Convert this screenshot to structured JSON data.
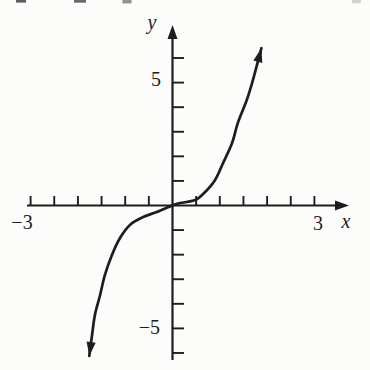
{
  "figure": {
    "background_color": "#fcfcfb",
    "ink_color": "#1d1d1d",
    "labels": {
      "y_axis": "y",
      "x_axis": "x",
      "y_max_tick": "5",
      "y_min_tick": "−5",
      "x_min_tick": "−3",
      "x_max_tick": "3"
    }
  },
  "chart_data": {
    "type": "line",
    "title": "",
    "xlabel": "x",
    "ylabel": "y",
    "x_range": [
      -3,
      3
    ],
    "y_range": [
      -6.5,
      7
    ],
    "x_tick_step": 0.5,
    "y_tick_step": 1,
    "x_labeled_ticks": [
      -3,
      3
    ],
    "y_labeled_ticks": [
      -5,
      5
    ],
    "grid": false,
    "legend": false,
    "series": [
      {
        "name": "curve",
        "description": "Hand-drawn S-shaped cubic curve (y = x^3 shape) through the origin, arrowheads on both ends",
        "points": [
          [
            -1.76,
            -6.12
          ],
          [
            -1.7,
            -5.26
          ],
          [
            -1.64,
            -4.45
          ],
          [
            -1.53,
            -3.64
          ],
          [
            -1.43,
            -2.83
          ],
          [
            -1.28,
            -2.01
          ],
          [
            -1.11,
            -1.32
          ],
          [
            -0.9,
            -0.79
          ],
          [
            -0.62,
            -0.47
          ],
          [
            -0.33,
            -0.26
          ],
          [
            0,
            0
          ],
          [
            0.16,
            0.1
          ],
          [
            0.48,
            0.22
          ],
          [
            0.69,
            0.55
          ],
          [
            0.9,
            1.04
          ],
          [
            1.07,
            1.73
          ],
          [
            1.26,
            2.54
          ],
          [
            1.38,
            3.35
          ],
          [
            1.57,
            4.29
          ],
          [
            1.7,
            5.1
          ],
          [
            1.88,
            6.4
          ]
        ]
      }
    ]
  }
}
